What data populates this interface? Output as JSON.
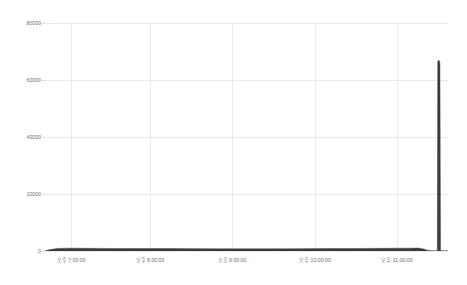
{
  "chart_data": {
    "type": "area",
    "title": "",
    "subtitle": "",
    "xlabel": "",
    "ylabel": "",
    "ylim": [
      0,
      80000
    ],
    "grid": true,
    "legend": false,
    "y_ticks": [
      {
        "label": "80000",
        "value": 80000
      },
      {
        "label": "60000",
        "value": 60000
      },
      {
        "label": "40000",
        "value": 40000
      },
      {
        "label": "20000",
        "value": 20000
      },
      {
        "label": "0",
        "value": 0
      }
    ],
    "x_ticks": [
      {
        "label": "오후 7:00:00",
        "pos": 0.065
      },
      {
        "label": "오후 8:00:00",
        "pos": 0.261
      },
      {
        "label": "오후 9:00:00",
        "pos": 0.464
      },
      {
        "label": "오후 10:00:00",
        "pos": 0.67
      },
      {
        "label": "오후 11:00:00",
        "pos": 0.874
      }
    ],
    "series": [
      {
        "name": "series-1",
        "color": "#3d3d3d",
        "points": [
          {
            "x": 0.0,
            "y": 0
          },
          {
            "x": 0.01,
            "y": 450
          },
          {
            "x": 0.03,
            "y": 900
          },
          {
            "x": 0.06,
            "y": 1000
          },
          {
            "x": 0.1,
            "y": 950
          },
          {
            "x": 0.15,
            "y": 900
          },
          {
            "x": 0.2,
            "y": 880
          },
          {
            "x": 0.26,
            "y": 860
          },
          {
            "x": 0.32,
            "y": 840
          },
          {
            "x": 0.4,
            "y": 820
          },
          {
            "x": 0.47,
            "y": 800
          },
          {
            "x": 0.55,
            "y": 800
          },
          {
            "x": 0.62,
            "y": 820
          },
          {
            "x": 0.7,
            "y": 850
          },
          {
            "x": 0.78,
            "y": 900
          },
          {
            "x": 0.85,
            "y": 950
          },
          {
            "x": 0.9,
            "y": 1000
          },
          {
            "x": 0.925,
            "y": 1050
          },
          {
            "x": 0.94,
            "y": 700
          },
          {
            "x": 0.95,
            "y": 200
          },
          {
            "x": 0.96,
            "y": 60
          },
          {
            "x": 0.968,
            "y": 40
          },
          {
            "x": 0.9735,
            "y": 100
          },
          {
            "x": 0.9745,
            "y": 66500
          },
          {
            "x": 0.9775,
            "y": 67000
          },
          {
            "x": 0.98,
            "y": 66000
          },
          {
            "x": 0.9815,
            "y": 200
          },
          {
            "x": 0.985,
            "y": 60
          },
          {
            "x": 1.0,
            "y": 40
          }
        ]
      }
    ],
    "peak": {
      "value": 67000,
      "x": 0.976
    }
  },
  "style": {
    "background": "#ffffff",
    "grid_color": "#e9e9e9",
    "tick_text_color": "#6f6f6f",
    "series_color": "#3d3d3d"
  }
}
